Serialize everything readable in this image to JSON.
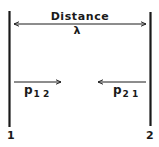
{
  "diagram": {
    "title": "Distance",
    "distance_symbol": "λ",
    "plates": [
      {
        "id": "1",
        "label": "1"
      },
      {
        "id": "2",
        "label": "2"
      }
    ],
    "flux_left": {
      "base": "p",
      "subscript": "1 2"
    },
    "flux_right": {
      "base": "p",
      "subscript": "2 1"
    },
    "colors": {
      "ink": "#1a1a1a",
      "background": "#ffffff"
    }
  }
}
